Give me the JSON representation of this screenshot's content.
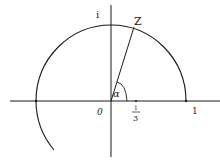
{
  "diagram": {
    "type": "unit-circle-complex-plane",
    "labels": {
      "imag_unit": "i",
      "point": "Z",
      "angle": "α",
      "origin": "0",
      "one": "1",
      "third_num": "1",
      "third_den": "3"
    },
    "colors": {
      "stroke": "#1a1a1a",
      "background": "#ffffff"
    }
  }
}
